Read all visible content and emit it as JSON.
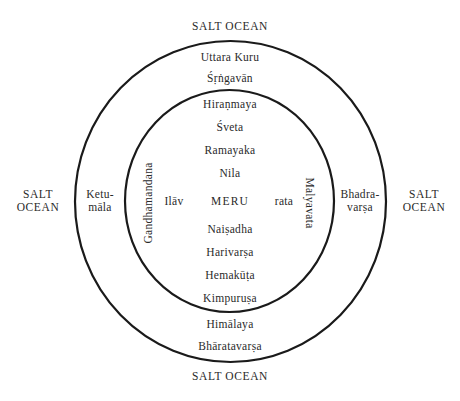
{
  "diagram": {
    "type": "concentric-cosmography",
    "center": "MERU",
    "colors": {
      "background": "#ffffff",
      "stroke": "#1a1a1a",
      "text": "#2a2a2a"
    },
    "ocean": {
      "top": "SALT OCEAN",
      "bottom": "SALT OCEAN",
      "left_line1": "SALT",
      "left_line2": "OCEAN",
      "right_line1": "SALT",
      "right_line2": "OCEAN"
    },
    "outer_ring": {
      "top": [
        "Uttara Kuru",
        "Śṛṅgavān"
      ],
      "bottom": [
        "Himālaya",
        "Bhāratavarṣa"
      ],
      "left_line1": "Ketu-",
      "left_line2": "māla",
      "right_line1": "Bhadra-",
      "right_line2": "varṣa"
    },
    "inner_circle": {
      "top": [
        "Hiraṇmaya",
        "Śveta",
        "Ramayaka",
        "Nila"
      ],
      "bottom": [
        "Naiṣadha",
        "Harivarṣa",
        "Hemakūṭa",
        "Kimpuruṣa"
      ],
      "left_vertical": "Gandhamandana",
      "right_vertical": "Malyavata",
      "center_left": "Ilāv",
      "center": "MERU",
      "center_right": "rata"
    }
  }
}
